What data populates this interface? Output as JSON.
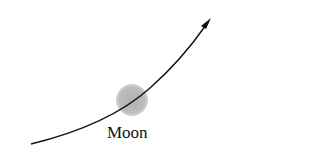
{
  "diagram": {
    "moon": {
      "label": "Moon",
      "color": "#b8b8b8",
      "center": [
        132,
        100
      ],
      "radius": 16
    },
    "trajectory": {
      "color": "#111111",
      "start": [
        31,
        144
      ],
      "end": [
        211,
        18
      ],
      "has_arrowhead": true
    }
  }
}
